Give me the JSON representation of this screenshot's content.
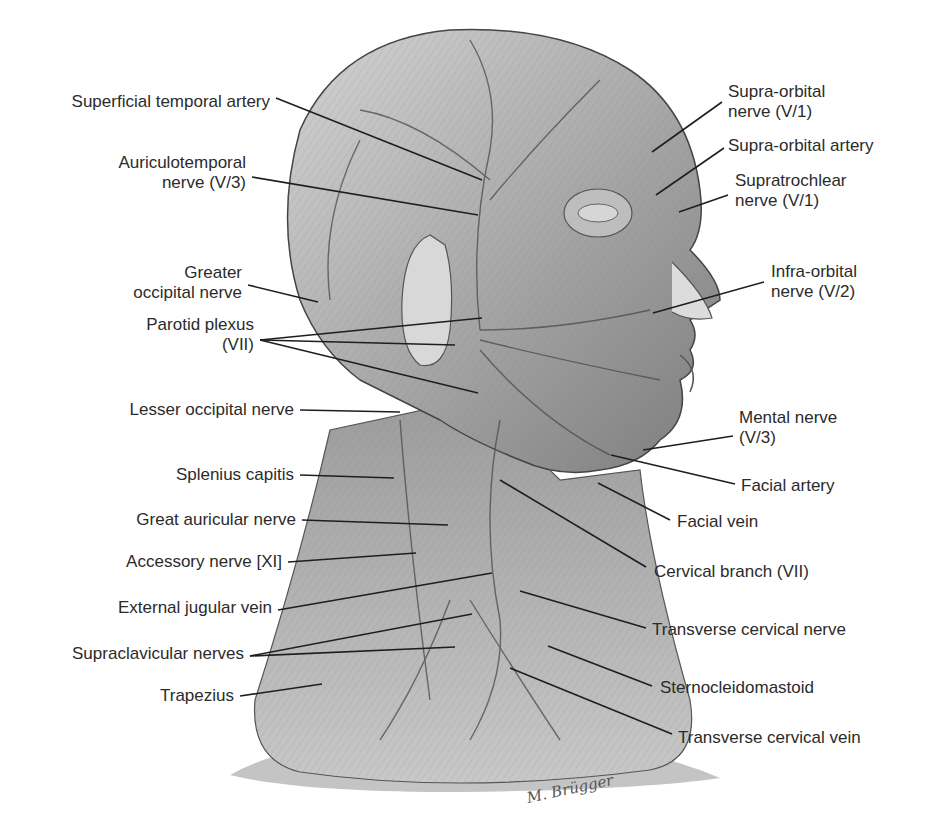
{
  "figure": {
    "type": "anatomical-illustration",
    "signature": "M. Brügger",
    "colors": {
      "background": "#ffffff",
      "ink": "#2b2b2b",
      "skin_light": "#cfcfcf",
      "skin_mid": "#a8a8a8",
      "skin_dark": "#6e6e6e",
      "base_shadow": "#bdbdbd"
    }
  },
  "labels_left": [
    {
      "id": "superficial-temporal-artery",
      "lines": [
        "Superficial temporal artery"
      ],
      "x": 26,
      "y": 92,
      "anchor": [
        276,
        98
      ],
      "targets": [
        [
          482,
          180
        ]
      ]
    },
    {
      "id": "auriculotemporal-nerve",
      "lines": [
        "Auriculotemporal",
        "nerve (V/3)"
      ],
      "x": 86,
      "y": 153,
      "anchor": [
        252,
        177
      ],
      "targets": [
        [
          478,
          215
        ]
      ]
    },
    {
      "id": "greater-occipital-nerve",
      "lines": [
        "Greater",
        "occipital nerve"
      ],
      "x": 104,
      "y": 263,
      "anchor": [
        248,
        285
      ],
      "targets": [
        [
          318,
          302
        ]
      ]
    },
    {
      "id": "parotid-plexus",
      "lines": [
        "Parotid plexus",
        "(VII)"
      ],
      "x": 120,
      "y": 315,
      "anchor": [
        260,
        340
      ],
      "targets": [
        [
          482,
          318
        ],
        [
          455,
          345
        ],
        [
          478,
          393
        ]
      ]
    },
    {
      "id": "lesser-occipital-nerve",
      "lines": [
        "Lesser occipital nerve"
      ],
      "x": 84,
      "y": 400,
      "anchor": [
        300,
        410
      ],
      "targets": [
        [
          400,
          412
        ]
      ]
    },
    {
      "id": "splenius-capitis",
      "lines": [
        "Splenius capitis"
      ],
      "x": 142,
      "y": 465,
      "anchor": [
        300,
        475
      ],
      "targets": [
        [
          394,
          478
        ]
      ]
    },
    {
      "id": "great-auricular-nerve",
      "lines": [
        "Great auricular nerve"
      ],
      "x": 93,
      "y": 510,
      "anchor": [
        302,
        520
      ],
      "targets": [
        [
          448,
          525
        ]
      ]
    },
    {
      "id": "accessory-nerve",
      "lines": [
        "Accessory nerve [XI]"
      ],
      "x": 82,
      "y": 552,
      "anchor": [
        288,
        562
      ],
      "targets": [
        [
          416,
          553
        ]
      ]
    },
    {
      "id": "external-jugular-vein",
      "lines": [
        "External jugular vein"
      ],
      "x": 78,
      "y": 598,
      "anchor": [
        278,
        610
      ],
      "targets": [
        [
          492,
          573
        ]
      ]
    },
    {
      "id": "supraclavicular-nerves",
      "lines": [
        "Supraclavicular nerves"
      ],
      "x": 30,
      "y": 644,
      "anchor": [
        250,
        656
      ],
      "targets": [
        [
          472,
          614
        ],
        [
          455,
          647
        ]
      ]
    },
    {
      "id": "trapezius",
      "lines": [
        "Trapezius"
      ],
      "x": 140,
      "y": 686,
      "anchor": [
        240,
        696
      ],
      "targets": [
        [
          322,
          684
        ]
      ]
    }
  ],
  "labels_right": [
    {
      "id": "supra-orbital-nerve",
      "lines": [
        "Supra-orbital",
        "nerve (V/1)"
      ],
      "x": 728,
      "y": 82,
      "anchor": [
        722,
        102
      ],
      "targets": [
        [
          652,
          152
        ]
      ]
    },
    {
      "id": "supra-orbital-artery",
      "lines": [
        "Supra-orbital artery"
      ],
      "x": 728,
      "y": 136,
      "anchor": [
        724,
        148
      ],
      "targets": [
        [
          656,
          195
        ]
      ]
    },
    {
      "id": "supratrochlear-nerve",
      "lines": [
        "Supratrochlear",
        "nerve (V/1)"
      ],
      "x": 735,
      "y": 171,
      "anchor": [
        728,
        195
      ],
      "targets": [
        [
          679,
          212
        ]
      ]
    },
    {
      "id": "infra-orbital-nerve",
      "lines": [
        "Infra-orbital",
        "nerve (V/2)"
      ],
      "x": 771,
      "y": 262,
      "anchor": [
        764,
        282
      ],
      "targets": [
        [
          653,
          313
        ]
      ]
    },
    {
      "id": "mental-nerve",
      "lines": [
        "Mental nerve",
        "(V/3)"
      ],
      "x": 739,
      "y": 408,
      "anchor": [
        733,
        436
      ],
      "targets": [
        [
          643,
          450
        ]
      ]
    },
    {
      "id": "facial-artery",
      "lines": [
        "Facial artery"
      ],
      "x": 741,
      "y": 476,
      "anchor": [
        735,
        484
      ],
      "targets": [
        [
          611,
          455
        ]
      ]
    },
    {
      "id": "facial-vein",
      "lines": [
        "Facial vein"
      ],
      "x": 677,
      "y": 512,
      "anchor": [
        670,
        520
      ],
      "targets": [
        [
          598,
          483
        ]
      ]
    },
    {
      "id": "cervical-branch",
      "lines": [
        "Cervical branch (VII)"
      ],
      "x": 654,
      "y": 562,
      "anchor": [
        646,
        567
      ],
      "targets": [
        [
          500,
          480
        ]
      ]
    },
    {
      "id": "transverse-cervical-nerve",
      "lines": [
        "Transverse cervical nerve"
      ],
      "x": 652,
      "y": 620,
      "anchor": [
        646,
        628
      ],
      "targets": [
        [
          520,
          591
        ]
      ]
    },
    {
      "id": "sternocleidomastoid",
      "lines": [
        "Sternocleidomastoid"
      ],
      "x": 660,
      "y": 678,
      "anchor": [
        652,
        686
      ],
      "targets": [
        [
          548,
          646
        ]
      ]
    },
    {
      "id": "transverse-cervical-vein",
      "lines": [
        "Transverse cervical vein"
      ],
      "x": 678,
      "y": 728,
      "anchor": [
        672,
        734
      ],
      "targets": [
        [
          510,
          668
        ]
      ]
    }
  ]
}
